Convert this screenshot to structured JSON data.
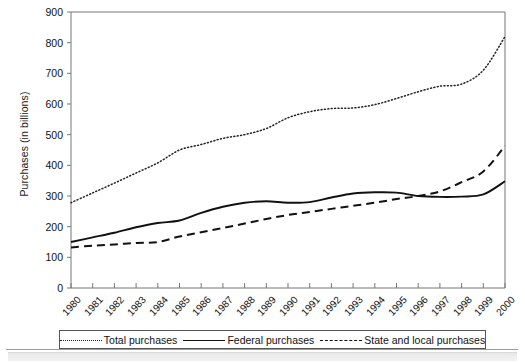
{
  "chart_data": {
    "type": "line",
    "title": "",
    "xlabel": "",
    "ylabel": "Purchases (in billions)",
    "ylim": [
      0,
      900
    ],
    "yticks": [
      0,
      100,
      200,
      300,
      400,
      500,
      600,
      700,
      800,
      900
    ],
    "grid": false,
    "legend_position": "bottom",
    "categories": [
      "1980",
      "1981",
      "1982",
      "1983",
      "1984",
      "1985",
      "1986",
      "1987",
      "1988",
      "1989",
      "1990",
      "1991",
      "1992",
      "1993",
      "1994",
      "1995",
      "1996",
      "1997",
      "1998",
      "1999",
      "2000"
    ],
    "series": [
      {
        "name": "Total purchases",
        "style": "dotted",
        "color": "#222222",
        "values": [
          278,
          310,
          342,
          375,
          408,
          450,
          468,
          488,
          500,
          520,
          555,
          575,
          585,
          587,
          598,
          618,
          640,
          658,
          665,
          710,
          820
        ]
      },
      {
        "name": "Federal purchases",
        "style": "solid",
        "color": "#111111",
        "values": [
          150,
          165,
          180,
          198,
          212,
          220,
          245,
          265,
          278,
          283,
          278,
          280,
          295,
          308,
          312,
          311,
          300,
          297,
          298,
          305,
          302
        ]
      },
      {
        "name": "State and local purchases",
        "style": "dashed",
        "color": "#111111",
        "values": [
          132,
          138,
          142,
          147,
          150,
          168,
          182,
          196,
          210,
          225,
          238,
          248,
          258,
          268,
          278,
          290,
          300,
          315,
          345,
          380,
          412
        ]
      }
    ],
    "series_endpoints_note": {
      "federal_2000": 348,
      "state_local_2000": 463
    }
  },
  "legend": {
    "items": [
      {
        "label": "Total purchases",
        "marker": "dotted-line-icon"
      },
      {
        "label": "Federal purchases",
        "marker": "solid-line-icon"
      },
      {
        "label": "State and local purchases",
        "marker": "dashed-line-icon"
      }
    ]
  },
  "axes": {
    "y_label": "Purchases (in billions)",
    "y_ticks": [
      "900",
      "800",
      "700",
      "600",
      "500",
      "400",
      "300",
      "200",
      "100",
      "0"
    ],
    "x_ticks": [
      "1980",
      "1981",
      "1982",
      "1983",
      "1984",
      "1985",
      "1986",
      "1987",
      "1988",
      "1989",
      "1990",
      "1991",
      "1992",
      "1993",
      "1994",
      "1995",
      "1996",
      "1997",
      "1998",
      "1999",
      "2000"
    ]
  },
  "colors": {
    "axis": "#777777",
    "ink": "#111111",
    "background": "#ffffff"
  }
}
